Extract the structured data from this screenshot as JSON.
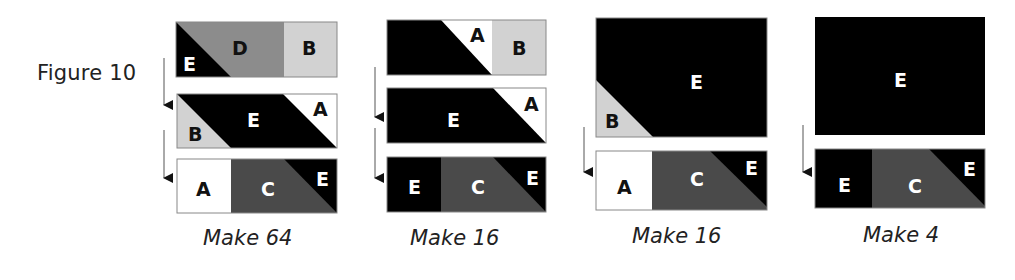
{
  "figure": {
    "title": "Figure 10",
    "colors": {
      "A": "#ffffff",
      "B": "#d2d2d2",
      "C": "#4a4a4a",
      "D": "#8c8c8c",
      "E": "#000000",
      "outline": "#888888",
      "arrow": "#333333"
    },
    "groups": [
      {
        "caption": "Make 64",
        "rows": [
          {
            "pieces": [
              "E",
              "D",
              "B"
            ],
            "labels": {
              "E": "E",
              "D": "D",
              "B": "B"
            }
          },
          {
            "pieces": [
              "B",
              "E",
              "A"
            ],
            "labels": {
              "B": "B",
              "E": "E",
              "A": "A"
            }
          },
          {
            "pieces": [
              "A",
              "C",
              "E"
            ],
            "labels": {
              "A": "A",
              "C": "C",
              "E": "E"
            }
          }
        ]
      },
      {
        "caption": "Make 16",
        "rows": [
          {
            "pieces": [
              "E",
              "A",
              "B"
            ],
            "labels": {
              "A": "A",
              "B": "B"
            }
          },
          {
            "pieces": [
              "E",
              "A"
            ],
            "labels": {
              "E": "E",
              "A": "A"
            }
          },
          {
            "pieces": [
              "E",
              "C",
              "E"
            ],
            "labels": {
              "E1": "E",
              "C": "C",
              "E2": "E"
            }
          }
        ]
      },
      {
        "caption": "Make 16",
        "rows": [
          {
            "pieces": [
              "B",
              "E"
            ],
            "labels": {
              "B": "B",
              "E": "E"
            }
          },
          {
            "pieces": [
              "A",
              "C",
              "E"
            ],
            "labels": {
              "A": "A",
              "C": "C",
              "E": "E"
            }
          }
        ]
      },
      {
        "caption": "Make 4",
        "rows": [
          {
            "pieces": [
              "E"
            ],
            "labels": {
              "E": "E"
            }
          },
          {
            "pieces": [
              "E",
              "C",
              "E"
            ],
            "labels": {
              "E1": "E",
              "C": "C",
              "E2": "E"
            }
          }
        ]
      }
    ]
  }
}
